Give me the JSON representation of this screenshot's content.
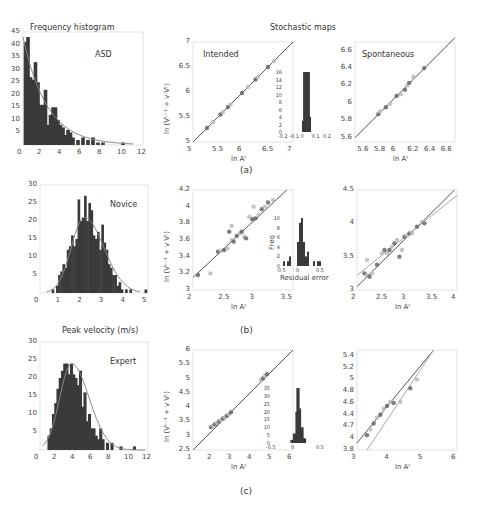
{
  "header": {
    "left_title": "Frequency histogram",
    "right_title": "Stochastic maps",
    "bottom_left_title": "Peak velocity (m/s)"
  },
  "rows": [
    {
      "label": "(a)"
    },
    {
      "label": "(b)"
    },
    {
      "label": "(c)"
    }
  ],
  "colors": {
    "bar": "#3a3a3a",
    "fit_line": "#888888",
    "identity_line": "#555555",
    "points_dark": "#666666",
    "points_light": "#bbbbbb",
    "frame": "#dddddd"
  },
  "chart_data": [
    {
      "id": "hist-asd",
      "type": "bar",
      "title": "Frequency histogram",
      "annotation": "ASD",
      "xlabel": "",
      "ylabel": "",
      "xlim": [
        0,
        12
      ],
      "ylim": [
        0,
        45
      ],
      "xticks": [
        0,
        2,
        4,
        6,
        8,
        10,
        12
      ],
      "yticks": [
        5,
        10,
        15,
        20,
        25,
        30,
        35,
        40,
        45
      ],
      "x": [
        0.25,
        0.5,
        0.75,
        1.0,
        1.25,
        1.5,
        1.75,
        2.0,
        2.25,
        2.5,
        2.75,
        3.0,
        3.25,
        3.5,
        3.75,
        4.0,
        4.25,
        4.5,
        4.75,
        5.0,
        5.5,
        6.0,
        6.5,
        7.0,
        7.5,
        8.0,
        10.0
      ],
      "values": [
        41,
        43,
        27,
        26,
        33,
        25,
        16,
        16,
        22,
        8,
        12,
        15,
        15,
        10,
        8,
        7,
        4,
        6,
        5,
        3,
        2,
        3,
        2,
        3,
        1,
        1,
        1
      ],
      "fit": "exponential decay"
    },
    {
      "id": "hist-novice",
      "type": "bar",
      "annotation": "Novice",
      "xlim": [
        0,
        5
      ],
      "ylim": [
        0,
        30
      ],
      "xticks": [
        0,
        1,
        2,
        3,
        4,
        5
      ],
      "yticks": [
        5,
        10,
        15,
        20,
        25,
        30
      ],
      "x": [
        0.6,
        0.8,
        0.9,
        1.0,
        1.1,
        1.2,
        1.3,
        1.4,
        1.5,
        1.6,
        1.7,
        1.8,
        1.9,
        2.0,
        2.1,
        2.2,
        2.3,
        2.4,
        2.5,
        2.6,
        2.7,
        2.8,
        2.9,
        3.0,
        3.1,
        3.2,
        3.3,
        3.4,
        3.5,
        3.6,
        3.7,
        3.8,
        4.0,
        4.2,
        4.9
      ],
      "values": [
        1,
        2,
        5,
        6,
        8,
        7,
        12,
        13,
        16,
        13,
        15,
        26,
        20,
        21,
        27,
        20,
        25,
        23,
        16,
        15,
        17,
        12,
        19,
        14,
        12,
        8,
        7,
        5,
        5,
        2,
        3,
        1,
        1,
        1,
        1
      ],
      "fit": "gamma"
    },
    {
      "id": "hist-expert",
      "type": "bar",
      "title": "Peak velocity (m/s)",
      "annotation": "Expert",
      "xlim": [
        0,
        12
      ],
      "ylim": [
        0,
        30
      ],
      "xticks": [
        0,
        2,
        4,
        6,
        8,
        10,
        12
      ],
      "yticks": [
        5,
        10,
        15,
        20,
        25,
        30
      ],
      "x": [
        1.0,
        1.25,
        1.5,
        1.75,
        2.0,
        2.25,
        2.5,
        2.75,
        3.0,
        3.25,
        3.5,
        3.75,
        4.0,
        4.25,
        4.5,
        4.75,
        5.0,
        5.25,
        5.5,
        5.75,
        6.0,
        6.25,
        6.5,
        6.75,
        7.0,
        7.5,
        8.0,
        9.0,
        10.5
      ],
      "values": [
        4,
        6,
        10,
        13,
        17,
        20,
        22,
        24,
        24,
        21,
        24,
        21,
        20,
        18,
        22,
        12,
        16,
        8,
        10,
        6,
        6,
        4,
        3,
        6,
        3,
        2,
        2,
        1,
        1
      ],
      "fit": "gamma"
    },
    {
      "id": "map-a-intended",
      "type": "scatter",
      "annotation": "Intended",
      "xlabel": "ln Aᵗmax",
      "ylabel": "ln (Vᵗ⁻¹max + v Vᵗmax)",
      "xlim": [
        5,
        7
      ],
      "ylim": [
        5,
        7
      ],
      "xticks": [
        5,
        5.5,
        6,
        6.5,
        7
      ],
      "yticks": [
        5,
        5.5,
        6,
        6.5,
        7
      ],
      "points": [
        [
          5.28,
          5.28
        ],
        [
          5.4,
          5.4
        ],
        [
          5.55,
          5.55
        ],
        [
          5.6,
          5.6
        ],
        [
          5.7,
          5.7
        ],
        [
          5.75,
          5.75
        ],
        [
          5.98,
          5.98
        ],
        [
          6.1,
          6.1
        ],
        [
          6.25,
          6.25
        ],
        [
          6.3,
          6.3
        ],
        [
          6.5,
          6.5
        ],
        [
          6.62,
          6.62
        ]
      ],
      "identity_line": [
        [
          5,
          5
        ],
        [
          7,
          7
        ]
      ],
      "inset": {
        "type": "bar",
        "xlim": [
          -0.2,
          0.2
        ],
        "ylim": [
          0,
          16
        ],
        "xticks": [
          -0.2,
          -0.1,
          0,
          0.1,
          0.2
        ],
        "yticks": [
          0,
          2,
          4,
          6,
          8,
          10,
          12,
          14,
          16
        ],
        "x": [
          -0.01,
          0,
          0.01
        ],
        "values": [
          3,
          16,
          4
        ]
      }
    },
    {
      "id": "map-a-spontaneous",
      "type": "scatter",
      "annotation": "Spontaneous",
      "xlabel": "ln Aᵗmax",
      "xlim": [
        5.5,
        6.7
      ],
      "ylim": [
        5.55,
        6.7
      ],
      "xticks": [
        5.6,
        5.8,
        6,
        6.2,
        6.4,
        6.6
      ],
      "yticks": [
        5.6,
        5.8,
        6,
        6.2,
        6.4,
        6.6
      ],
      "points": [
        [
          5.78,
          5.87
        ],
        [
          5.8,
          5.9
        ],
        [
          5.87,
          5.95
        ],
        [
          5.92,
          5.99
        ],
        [
          6.0,
          6.08
        ],
        [
          6.05,
          6.1
        ],
        [
          6.1,
          6.15
        ],
        [
          6.13,
          6.2
        ],
        [
          6.15,
          6.23
        ],
        [
          6.2,
          6.3
        ],
        [
          6.33,
          6.4
        ]
      ],
      "identity_line": [
        [
          5.5,
          5.6
        ],
        [
          6.7,
          6.75
        ]
      ]
    },
    {
      "id": "map-b-left",
      "type": "scatter",
      "xlabel": "ln Aᵗmax",
      "ylabel": "ln (Vᵗ⁻¹max + v Vᵗmax)",
      "xlim": [
        2,
        3.6
      ],
      "ylim": [
        3,
        4.2
      ],
      "xticks": [
        2,
        2.5,
        3,
        3.5
      ],
      "yticks": [
        3,
        3.2,
        3.4,
        3.6,
        3.8,
        4,
        4.2
      ],
      "points": [
        [
          2.08,
          3.18
        ],
        [
          2.28,
          3.2
        ],
        [
          2.4,
          3.46
        ],
        [
          2.45,
          3.47
        ],
        [
          2.5,
          3.48
        ],
        [
          2.55,
          3.5
        ],
        [
          2.58,
          3.7
        ],
        [
          2.62,
          3.6
        ],
        [
          2.65,
          3.58
        ],
        [
          2.62,
          3.77
        ],
        [
          2.7,
          3.65
        ],
        [
          2.75,
          3.68
        ],
        [
          2.78,
          3.7
        ],
        [
          2.82,
          3.64
        ],
        [
          2.85,
          3.62
        ],
        [
          2.9,
          3.88
        ],
        [
          2.95,
          3.85
        ],
        [
          2.97,
          4.0
        ],
        [
          3.0,
          3.86
        ],
        [
          3.05,
          3.9
        ],
        [
          3.1,
          3.97
        ],
        [
          3.15,
          4.0
        ],
        [
          3.2,
          4.05
        ],
        [
          3.28,
          4.08
        ]
      ],
      "identity_line": [
        [
          2,
          3.15
        ],
        [
          3.5,
          4.2
        ]
      ],
      "inset": {
        "type": "bar",
        "xlabel": "Residual error",
        "ylabel": "Freq",
        "xlim": [
          -0.5,
          0.5
        ],
        "ylim": [
          0,
          10
        ],
        "xticks": [
          -0.5,
          0,
          0.5
        ],
        "yticks": [
          0,
          2,
          4,
          6,
          8,
          10
        ],
        "x": [
          -0.45,
          -0.35,
          -0.3,
          -0.2,
          -0.1,
          -0.05,
          0,
          0.05,
          0.1,
          0.15,
          0.3,
          0.4,
          0.45
        ],
        "values": [
          1,
          1,
          2,
          0,
          5,
          9,
          10,
          5,
          2,
          3,
          1,
          1,
          1
        ]
      }
    },
    {
      "id": "map-b-right",
      "type": "scatter",
      "xlabel": "ln Aᵗmax",
      "xlim": [
        2,
        4
      ],
      "ylim": [
        3,
        4.5
      ],
      "xticks": [
        2,
        2.5,
        3,
        3.5,
        4
      ],
      "yticks": [
        3,
        3.5,
        4,
        4.5
      ],
      "points": [
        [
          2.15,
          3.25
        ],
        [
          2.2,
          3.22
        ],
        [
          2.25,
          3.2
        ],
        [
          2.3,
          3.25
        ],
        [
          2.4,
          3.38
        ],
        [
          2.5,
          3.55
        ],
        [
          2.55,
          3.6
        ],
        [
          2.6,
          3.55
        ],
        [
          2.65,
          3.6
        ],
        [
          2.7,
          3.65
        ],
        [
          2.75,
          3.7
        ],
        [
          2.8,
          3.75
        ],
        [
          2.85,
          3.5
        ],
        [
          2.9,
          3.6
        ],
        [
          2.95,
          3.8
        ],
        [
          3.0,
          3.82
        ],
        [
          3.05,
          3.85
        ],
        [
          3.1,
          3.85
        ],
        [
          3.2,
          3.95
        ],
        [
          3.3,
          4.02
        ],
        [
          3.35,
          4.0
        ],
        [
          2.2,
          3.45
        ]
      ],
      "lines": [
        [
          [
            2,
            3.05
          ],
          [
            3.95,
            4.5
          ]
        ],
        [
          [
            2,
            3.22
          ],
          [
            4,
            4.42
          ]
        ]
      ]
    },
    {
      "id": "map-c-left",
      "type": "scatter",
      "xlabel": "ln Aᵗmax",
      "ylabel": "ln (Vᵗ⁻¹max + v Vᵗmax)",
      "xlim": [
        1,
        6
      ],
      "ylim": [
        2.5,
        6
      ],
      "xticks": [
        1,
        2,
        3,
        4,
        5,
        6
      ],
      "yticks": [
        2.5,
        3,
        3.5,
        4,
        4.5,
        5,
        5.5,
        6
      ],
      "points": [
        [
          1.9,
          3.3
        ],
        [
          2.0,
          3.35
        ],
        [
          2.1,
          3.4
        ],
        [
          2.2,
          3.45
        ],
        [
          2.3,
          3.5
        ],
        [
          2.4,
          3.55
        ],
        [
          2.5,
          3.6
        ],
        [
          2.6,
          3.65
        ],
        [
          2.7,
          3.7
        ],
        [
          2.8,
          3.75
        ],
        [
          2.9,
          3.82
        ],
        [
          4.4,
          4.95
        ],
        [
          4.5,
          5.0
        ],
        [
          4.6,
          5.1
        ],
        [
          4.7,
          5.15
        ]
      ],
      "identity_line": [
        [
          1,
          2.5
        ],
        [
          6,
          6
        ]
      ],
      "inset": {
        "type": "bar",
        "xlim": [
          -0.5,
          0.5
        ],
        "ylim": [
          0,
          35
        ],
        "xticks": [
          -0.5,
          0,
          0.5
        ],
        "yticks": [
          0,
          5,
          10,
          15,
          20,
          25,
          30,
          35
        ],
        "x": [
          -0.1,
          -0.05,
          0,
          0.02,
          0.05,
          0.1,
          0.15
        ],
        "values": [
          2,
          6,
          20,
          35,
          22,
          10,
          3
        ]
      }
    },
    {
      "id": "map-c-right",
      "type": "scatter",
      "xlabel": "ln Aᵗmax",
      "xlim": [
        3,
        6
      ],
      "ylim": [
        3.8,
        5.5
      ],
      "xticks": [
        3,
        4,
        5,
        6
      ],
      "yticks": [
        3.8,
        4,
        4.2,
        4.4,
        4.6,
        4.8,
        5,
        5.2,
        5.4
      ],
      "ytick_labels": [
        "3.8",
        "4",
        "4.7",
        "4.4",
        "4.6",
        "4.8",
        "5",
        "5.2",
        "5.4"
      ],
      "points": [
        [
          3.3,
          4.05
        ],
        [
          3.4,
          4.15
        ],
        [
          3.5,
          4.25
        ],
        [
          3.6,
          4.35
        ],
        [
          3.7,
          4.4
        ],
        [
          3.8,
          4.5
        ],
        [
          3.9,
          4.55
        ],
        [
          4.0,
          4.62
        ],
        [
          4.1,
          4.6
        ],
        [
          4.3,
          4.62
        ],
        [
          4.6,
          4.85
        ],
        [
          4.8,
          5.0
        ]
      ],
      "lines": [
        [
          [
            3,
            3.92
          ],
          [
            5.3,
            5.5
          ]
        ],
        [
          [
            3.3,
            3.8
          ],
          [
            5.3,
            5.5
          ]
        ]
      ]
    }
  ]
}
